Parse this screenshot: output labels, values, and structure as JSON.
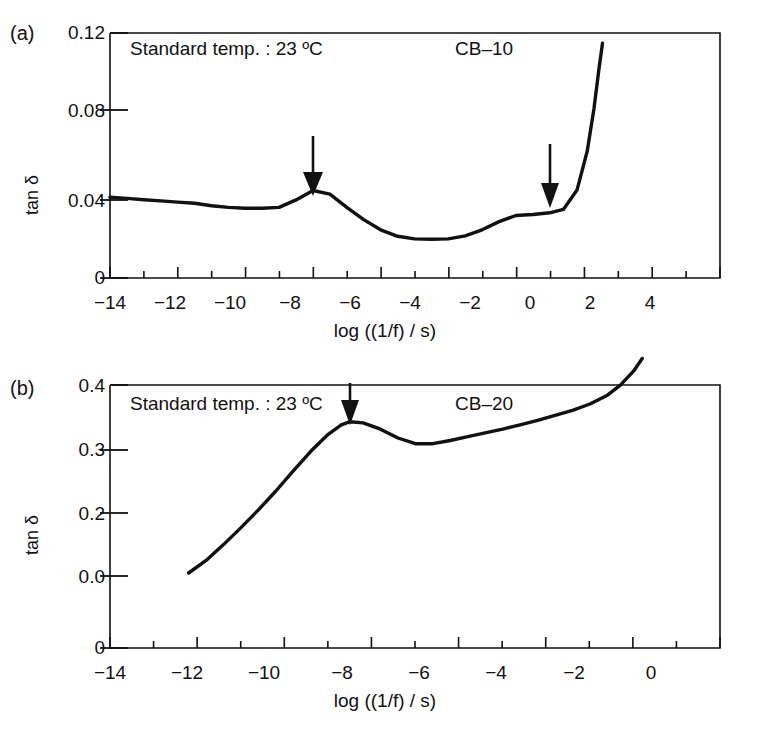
{
  "figure": {
    "panels": [
      {
        "id": "a",
        "letter": "(a)",
        "sample_label": "CB–10",
        "condition_label": "Standard temp. : 23 ºC",
        "xlabel": "log ((1/f) / s)",
        "ylabel": "tan δ"
      },
      {
        "id": "b",
        "letter": "(b)",
        "sample_label": "CB–20",
        "condition_label": "Standard temp. : 23 ºC",
        "xlabel": "log ((1/f) / s)",
        "ylabel": "tan δ"
      }
    ],
    "bottom_caption_fragment": ""
  },
  "chart_data": [
    {
      "type": "line",
      "panel": "a",
      "title": "CB–10",
      "subtitle": "Standard temp. : 23 ºC",
      "xlabel": "log ((1/f) / s)",
      "ylabel": "tan δ",
      "xlim": [
        -14,
        4
      ],
      "ylim": [
        0,
        0.12
      ],
      "grid": false,
      "legend": "none",
      "x_major_ticks": [
        -14,
        -12,
        -10,
        -8,
        -6,
        -4,
        -2,
        0,
        2,
        4
      ],
      "x_minor_tick_step": 1,
      "y_major_ticks": [
        0,
        0.04,
        0.08,
        0.12
      ],
      "y_tick_labels": [
        "0",
        "0.04",
        "0.08",
        "0.12"
      ],
      "x_tick_labels": [
        "−14",
        "−12",
        "−10",
        "−8",
        "−6",
        "−4",
        "−2",
        "0",
        "2",
        "4"
      ],
      "series": [
        {
          "name": "CB-10 tan delta",
          "x": [
            -13.0,
            -12.5,
            -12.0,
            -11.5,
            -11.0,
            -10.5,
            -10.0,
            -9.5,
            -9.0,
            -8.5,
            -8.0,
            -7.5,
            -7.0,
            -6.5,
            -6.0,
            -5.5,
            -5.0,
            -4.5,
            -4.0,
            -3.5,
            -3.0,
            -2.5,
            -2.0,
            -1.5,
            -1.0,
            -0.5,
            0.0,
            0.4,
            0.8,
            1.1,
            1.3,
            1.45,
            1.55
          ],
          "y": [
            0.0395,
            0.0389,
            0.0383,
            0.0377,
            0.0371,
            0.0365,
            0.0353,
            0.0345,
            0.0341,
            0.0341,
            0.0345,
            0.0382,
            0.0428,
            0.041,
            0.0345,
            0.0285,
            0.0235,
            0.0203,
            0.019,
            0.0188,
            0.019,
            0.0205,
            0.0235,
            0.0275,
            0.0305,
            0.031,
            0.0318,
            0.0335,
            0.043,
            0.062,
            0.083,
            0.103,
            0.115
          ]
        }
      ],
      "annotations": [
        {
          "type": "arrow",
          "label": "transition-marker-1",
          "x": -7.0,
          "y_tip": 0.045,
          "y_tail": 0.076,
          "direction": "down"
        },
        {
          "type": "arrow",
          "label": "transition-marker-2",
          "x": -1.0,
          "y_tip": 0.033,
          "y_tail": 0.066,
          "direction": "down"
        }
      ]
    },
    {
      "type": "line",
      "panel": "b",
      "title": "CB–20",
      "subtitle": "Standard temp. : 23 ºC",
      "xlabel": "log ((1/f) / s)",
      "ylabel": "tan δ",
      "xlim": [
        -14,
        0
      ],
      "ylim": [
        0.0,
        0.4
      ],
      "grid": false,
      "legend": "none",
      "x_major_ticks": [
        -14,
        -12,
        -10,
        -8,
        -6,
        -4,
        -2,
        0
      ],
      "x_minor_tick_step": 1,
      "y_major_ticks": [
        0.0,
        0.2,
        0.3,
        0.4
      ],
      "y_tick_labels": [
        "0.0",
        "0.2",
        "0.3",
        "0.4"
      ],
      "y_baseline_label": "0",
      "y_axis_broken": true,
      "x_tick_labels": [
        "−14",
        "−12",
        "−10",
        "−8",
        "−6",
        "−4",
        "−2",
        "0"
      ],
      "series": [
        {
          "name": "CB-20 tan delta",
          "x": [
            -12.2,
            -11.8,
            -11.4,
            -11.0,
            -10.6,
            -10.2,
            -9.8,
            -9.4,
            -9.0,
            -8.7,
            -8.5,
            -8.2,
            -7.8,
            -7.4,
            -7.0,
            -6.6,
            -6.2,
            -5.8,
            -5.4,
            -5.0,
            -4.6,
            -4.2,
            -3.8,
            -3.4,
            -3.0,
            -2.6,
            -2.3,
            -2.0,
            -1.8,
            -1.6,
            -1.45,
            -1.35
          ],
          "y": [
            0.01,
            0.03,
            0.055,
            0.082,
            0.11,
            0.14,
            0.172,
            0.203,
            0.23,
            0.245,
            0.25,
            0.248,
            0.238,
            0.224,
            0.215,
            0.215,
            0.22,
            0.226,
            0.232,
            0.238,
            0.245,
            0.252,
            0.26,
            0.268,
            0.278,
            0.292,
            0.308,
            0.33,
            0.35,
            0.372,
            0.392,
            0.402
          ]
        }
      ],
      "annotations": [
        {
          "type": "arrow",
          "label": "transition-marker-1",
          "x": -8.5,
          "y_tip": 0.262,
          "y_tail": 0.36,
          "direction": "down"
        }
      ]
    }
  ]
}
